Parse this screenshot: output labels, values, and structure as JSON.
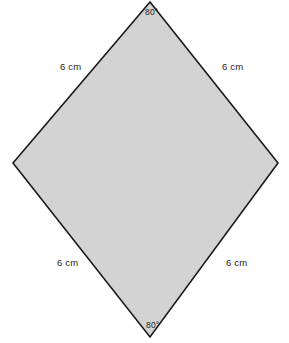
{
  "figure": {
    "shape_name": "rhombus",
    "background_color": "#ffffff",
    "fill_color": "#d2d3d2",
    "stroke_color": "#1a1a1a",
    "stroke_width": 1.6,
    "vertices": {
      "top": [
        150,
        2
      ],
      "right": [
        278,
        163
      ],
      "bottom": [
        150,
        337
      ],
      "left": [
        13,
        163
      ]
    },
    "polygon_points": "150,2 278,163 150,337 13,163",
    "sides": [
      {
        "position": "top-left",
        "label": "6 cm"
      },
      {
        "position": "top-right",
        "label": "6 cm"
      },
      {
        "position": "bottom-left",
        "label": "6 cm"
      },
      {
        "position": "bottom-right",
        "label": "6 cm"
      }
    ],
    "angles": [
      {
        "position": "top",
        "label": "80°"
      },
      {
        "position": "bottom",
        "label": "80°"
      }
    ]
  }
}
